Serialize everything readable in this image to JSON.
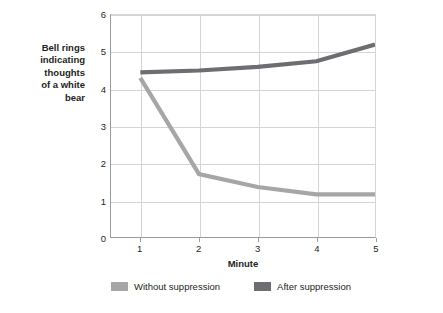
{
  "chart_data": {
    "type": "line",
    "title": "",
    "xlabel": "Minute",
    "ylabel": "Bell rings indicating thoughts of a white bear",
    "x": [
      1,
      2,
      3,
      4,
      5
    ],
    "xticklabels": [
      "1",
      "2",
      "3",
      "4",
      "5"
    ],
    "yticklabels": [
      "0",
      "1",
      "2",
      "3",
      "4",
      "5",
      "6"
    ],
    "xlim": [
      0.5,
      5.0
    ],
    "ylim": [
      0,
      6
    ],
    "grid": "both",
    "legend_position": "bottom-center",
    "series": [
      {
        "name": "Without suppression",
        "color": "#a6a6a6",
        "values": [
          4.3,
          1.7,
          1.35,
          1.15,
          1.15
        ]
      },
      {
        "name": "After suppression",
        "color": "#6d6e71",
        "values": [
          4.45,
          4.5,
          4.6,
          4.75,
          5.2
        ]
      }
    ]
  },
  "axis": {
    "ylabel_text": "Bell rings\nindicating\nthoughts\nof a white\nbear",
    "xlabel_text": "Minute",
    "yticks": [
      "6",
      "5",
      "4",
      "3",
      "2",
      "1",
      "0"
    ],
    "xticks": [
      "1",
      "2",
      "3",
      "4",
      "5"
    ]
  },
  "legend": {
    "items": [
      {
        "label": "Without suppression",
        "color": "#a6a6a6"
      },
      {
        "label": "After suppression",
        "color": "#6d6e71"
      }
    ]
  },
  "colors": {
    "without_suppression": "#a6a6a6",
    "after_suppression": "#6d6e71",
    "grid": "#d4d4d4",
    "axis": "#9a9a9a",
    "text": "#231f20",
    "background": "#ffffff"
  }
}
